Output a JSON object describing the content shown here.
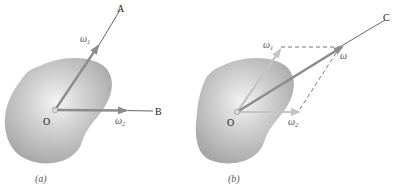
{
  "figure": {
    "panel_a": {
      "caption": "(a)",
      "origin_label": "O",
      "axis_labels": {
        "a": "A",
        "b": "B"
      },
      "vectors": {
        "omega1": {
          "symbol": "ω",
          "subscript": "1"
        },
        "omega2": {
          "symbol": "ω",
          "subscript": "2"
        }
      }
    },
    "panel_b": {
      "caption": "(b)",
      "origin_label": "O",
      "axis_labels": {
        "c": "C"
      },
      "vectors": {
        "omega1": {
          "symbol": "ω",
          "subscript": "1"
        },
        "omega2": {
          "symbol": "ω",
          "subscript": "2"
        },
        "omega": {
          "symbol": "ω"
        }
      }
    }
  },
  "colors": {
    "body_fill_light": "#f2f2f2",
    "body_fill_dark": "#a8a8a8",
    "arrow_main": "#8c8c8c",
    "arrow_faded": "#c4c4c4",
    "axis_line": "#555555",
    "dash_line": "#666666"
  }
}
